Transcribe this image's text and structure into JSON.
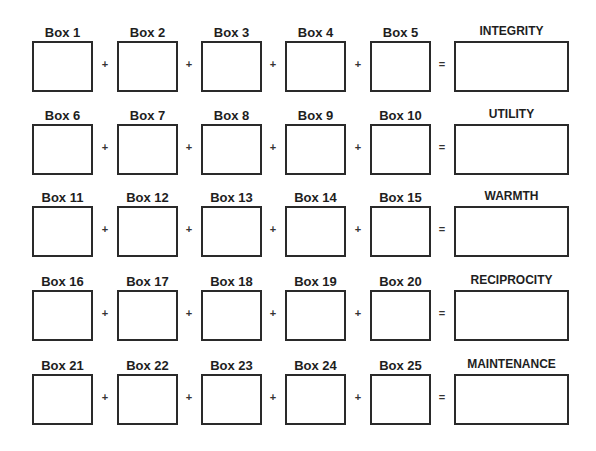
{
  "worksheet": {
    "operators": {
      "plus": "+",
      "equals": "="
    },
    "rows": [
      {
        "boxes": [
          {
            "label": "Box 1",
            "value": ""
          },
          {
            "label": "Box 2",
            "value": ""
          },
          {
            "label": "Box 3",
            "value": ""
          },
          {
            "label": "Box 4",
            "value": ""
          },
          {
            "label": "Box 5",
            "value": ""
          }
        ],
        "result": {
          "label": "INTEGRITY",
          "value": ""
        }
      },
      {
        "boxes": [
          {
            "label": "Box 6",
            "value": ""
          },
          {
            "label": "Box 7",
            "value": ""
          },
          {
            "label": "Box 8",
            "value": ""
          },
          {
            "label": "Box 9",
            "value": ""
          },
          {
            "label": "Box 10",
            "value": ""
          }
        ],
        "result": {
          "label": "UTILITY",
          "value": ""
        }
      },
      {
        "boxes": [
          {
            "label": "Box 11",
            "value": ""
          },
          {
            "label": "Box 12",
            "value": ""
          },
          {
            "label": "Box 13",
            "value": ""
          },
          {
            "label": "Box 14",
            "value": ""
          },
          {
            "label": "Box 15",
            "value": ""
          }
        ],
        "result": {
          "label": "WARMTH",
          "value": ""
        }
      },
      {
        "boxes": [
          {
            "label": "Box 16",
            "value": ""
          },
          {
            "label": "Box 17",
            "value": ""
          },
          {
            "label": "Box 18",
            "value": ""
          },
          {
            "label": "Box 19",
            "value": ""
          },
          {
            "label": "Box 20",
            "value": ""
          }
        ],
        "result": {
          "label": "RECIPROCITY",
          "value": ""
        }
      },
      {
        "boxes": [
          {
            "label": "Box 21",
            "value": ""
          },
          {
            "label": "Box 22",
            "value": ""
          },
          {
            "label": "Box 23",
            "value": ""
          },
          {
            "label": "Box 24",
            "value": ""
          },
          {
            "label": "Box 25",
            "value": ""
          }
        ],
        "result": {
          "label": "MAINTENANCE",
          "value": ""
        }
      }
    ]
  }
}
